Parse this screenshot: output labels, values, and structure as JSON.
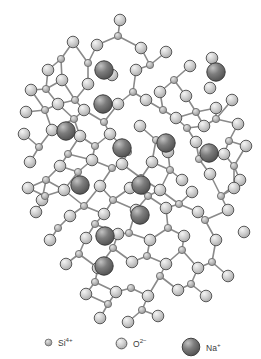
{
  "figure": {
    "background_color": "#ffffff",
    "width": 261,
    "height": 359
  },
  "species": {
    "si": {
      "id": "Si4+",
      "label_base": "Si",
      "label_sup": "4+",
      "icon": "small-circle-marker",
      "radius": 3.6,
      "fill": "#b4b4b4",
      "stroke": "#6e6e6e",
      "highlight": "#e8e8e8"
    },
    "o": {
      "id": "O2-",
      "label_base": "O",
      "label_sup": "2−",
      "icon": "medium-circle-marker",
      "radius": 5.8,
      "fill": "#c9c9c9",
      "stroke": "#5a5a5a",
      "highlight": "#f2f2f2"
    },
    "na": {
      "id": "Na+",
      "label_base": "Na",
      "label_sup": "+",
      "icon": "large-sphere-marker",
      "radius": 9.2,
      "fill": "#6a6a6a",
      "stroke": "#3c3c3c",
      "highlight": "#bdbdbd"
    }
  },
  "legend": {
    "position": "bottom",
    "items": [
      {
        "species": "si",
        "x": 44,
        "y": 14,
        "marker_r": 3.6,
        "label_base": "Si",
        "label_sup": "4+"
      },
      {
        "species": "o",
        "x": 115,
        "y": 14,
        "marker_r": 5.6,
        "label_base": "O",
        "label_sup": "2−"
      },
      {
        "species": "na",
        "x": 181,
        "y": 14,
        "marker_r": 9.0,
        "label_base": "Na",
        "label_sup": "+"
      }
    ]
  },
  "bonds": {
    "stroke": "#8a8a8a",
    "width": 1.6,
    "pairs": [
      [
        0,
        1
      ],
      [
        1,
        2
      ],
      [
        2,
        3
      ],
      [
        3,
        4
      ],
      [
        4,
        5
      ],
      [
        5,
        6
      ],
      [
        6,
        7
      ],
      [
        8,
        9
      ],
      [
        9,
        10
      ],
      [
        10,
        11
      ],
      [
        11,
        12
      ],
      [
        12,
        13
      ],
      [
        14,
        15
      ],
      [
        15,
        16
      ],
      [
        16,
        17
      ],
      [
        17,
        18
      ],
      [
        19,
        20
      ],
      [
        20,
        21
      ],
      [
        21,
        22
      ],
      [
        22,
        23
      ],
      [
        23,
        24
      ],
      [
        25,
        26
      ],
      [
        26,
        27
      ],
      [
        27,
        28
      ],
      [
        28,
        29
      ],
      [
        30,
        31
      ],
      [
        31,
        32
      ],
      [
        32,
        33
      ],
      [
        33,
        34
      ],
      [
        34,
        35
      ],
      [
        36,
        37
      ],
      [
        37,
        38
      ],
      [
        38,
        39
      ],
      [
        39,
        40
      ],
      [
        41,
        42
      ],
      [
        42,
        43
      ],
      [
        43,
        44
      ],
      [
        44,
        45
      ],
      [
        45,
        46
      ],
      [
        47,
        48
      ],
      [
        48,
        49
      ],
      [
        49,
        50
      ],
      [
        50,
        51
      ]
    ]
  },
  "atoms": {
    "si": [
      {
        "x": 118,
        "y": 36
      },
      {
        "x": 61,
        "y": 59
      },
      {
        "x": 88,
        "y": 63
      },
      {
        "x": 150,
        "y": 65
      },
      {
        "x": 46,
        "y": 89
      },
      {
        "x": 75,
        "y": 100
      },
      {
        "x": 133,
        "y": 92
      },
      {
        "x": 174,
        "y": 80
      },
      {
        "x": 45,
        "y": 110
      },
      {
        "x": 74,
        "y": 119
      },
      {
        "x": 104,
        "y": 122
      },
      {
        "x": 163,
        "y": 110
      },
      {
        "x": 196,
        "y": 112
      },
      {
        "x": 39,
        "y": 147
      },
      {
        "x": 68,
        "y": 154
      },
      {
        "x": 95,
        "y": 146
      },
      {
        "x": 128,
        "y": 152
      },
      {
        "x": 156,
        "y": 140
      },
      {
        "x": 187,
        "y": 128
      },
      {
        "x": 216,
        "y": 119
      },
      {
        "x": 229,
        "y": 141
      },
      {
        "x": 46,
        "y": 180
      },
      {
        "x": 78,
        "y": 172
      },
      {
        "x": 112,
        "y": 168
      },
      {
        "x": 141,
        "y": 178
      },
      {
        "x": 170,
        "y": 170
      },
      {
        "x": 199,
        "y": 159
      },
      {
        "x": 234,
        "y": 166
      },
      {
        "x": 45,
        "y": 196
      },
      {
        "x": 84,
        "y": 206
      },
      {
        "x": 113,
        "y": 200
      },
      {
        "x": 148,
        "y": 196
      },
      {
        "x": 179,
        "y": 204
      },
      {
        "x": 221,
        "y": 196
      },
      {
        "x": 58,
        "y": 228
      },
      {
        "x": 95,
        "y": 224
      },
      {
        "x": 129,
        "y": 233
      },
      {
        "x": 168,
        "y": 228
      },
      {
        "x": 205,
        "y": 220
      },
      {
        "x": 79,
        "y": 254
      },
      {
        "x": 113,
        "y": 248
      },
      {
        "x": 147,
        "y": 256
      },
      {
        "x": 182,
        "y": 250
      },
      {
        "x": 212,
        "y": 262
      },
      {
        "x": 95,
        "y": 282
      },
      {
        "x": 131,
        "y": 288
      },
      {
        "x": 160,
        "y": 276
      },
      {
        "x": 191,
        "y": 284
      },
      {
        "x": 108,
        "y": 304
      },
      {
        "x": 142,
        "y": 310
      }
    ],
    "o": [
      {
        "x": 120,
        "y": 20
      },
      {
        "x": 97,
        "y": 45
      },
      {
        "x": 141,
        "y": 48
      },
      {
        "x": 73,
        "y": 42
      },
      {
        "x": 48,
        "y": 70
      },
      {
        "x": 166,
        "y": 52
      },
      {
        "x": 190,
        "y": 66
      },
      {
        "x": 212,
        "y": 58
      },
      {
        "x": 31,
        "y": 90
      },
      {
        "x": 62,
        "y": 80
      },
      {
        "x": 88,
        "y": 84
      },
      {
        "x": 112,
        "y": 75
      },
      {
        "x": 136,
        "y": 70
      },
      {
        "x": 160,
        "y": 92
      },
      {
        "x": 186,
        "y": 96
      },
      {
        "x": 210,
        "y": 88
      },
      {
        "x": 232,
        "y": 100
      },
      {
        "x": 26,
        "y": 112
      },
      {
        "x": 58,
        "y": 104
      },
      {
        "x": 84,
        "y": 110
      },
      {
        "x": 118,
        "y": 104
      },
      {
        "x": 146,
        "y": 100
      },
      {
        "x": 176,
        "y": 118
      },
      {
        "x": 204,
        "y": 126
      },
      {
        "x": 238,
        "y": 124
      },
      {
        "x": 24,
        "y": 134
      },
      {
        "x": 52,
        "y": 130
      },
      {
        "x": 80,
        "y": 136
      },
      {
        "x": 110,
        "y": 134
      },
      {
        "x": 140,
        "y": 126
      },
      {
        "x": 168,
        "y": 152
      },
      {
        "x": 196,
        "y": 142
      },
      {
        "x": 224,
        "y": 154
      },
      {
        "x": 246,
        "y": 146
      },
      {
        "x": 30,
        "y": 162
      },
      {
        "x": 60,
        "y": 166
      },
      {
        "x": 92,
        "y": 160
      },
      {
        "x": 122,
        "y": 164
      },
      {
        "x": 152,
        "y": 162
      },
      {
        "x": 182,
        "y": 180
      },
      {
        "x": 210,
        "y": 174
      },
      {
        "x": 240,
        "y": 180
      },
      {
        "x": 28,
        "y": 188
      },
      {
        "x": 64,
        "y": 190
      },
      {
        "x": 100,
        "y": 186
      },
      {
        "x": 130,
        "y": 188
      },
      {
        "x": 160,
        "y": 190
      },
      {
        "x": 192,
        "y": 192
      },
      {
        "x": 234,
        "y": 188
      },
      {
        "x": 36,
        "y": 212
      },
      {
        "x": 70,
        "y": 216
      },
      {
        "x": 104,
        "y": 214
      },
      {
        "x": 136,
        "y": 210
      },
      {
        "x": 166,
        "y": 208
      },
      {
        "x": 198,
        "y": 212
      },
      {
        "x": 228,
        "y": 210
      },
      {
        "x": 50,
        "y": 240
      },
      {
        "x": 86,
        "y": 238
      },
      {
        "x": 118,
        "y": 234
      },
      {
        "x": 150,
        "y": 240
      },
      {
        "x": 184,
        "y": 236
      },
      {
        "x": 216,
        "y": 240
      },
      {
        "x": 244,
        "y": 232
      },
      {
        "x": 66,
        "y": 264
      },
      {
        "x": 98,
        "y": 268
      },
      {
        "x": 132,
        "y": 262
      },
      {
        "x": 166,
        "y": 264
      },
      {
        "x": 198,
        "y": 268
      },
      {
        "x": 228,
        "y": 276
      },
      {
        "x": 86,
        "y": 294
      },
      {
        "x": 116,
        "y": 292
      },
      {
        "x": 148,
        "y": 296
      },
      {
        "x": 178,
        "y": 290
      },
      {
        "x": 206,
        "y": 296
      },
      {
        "x": 100,
        "y": 318
      },
      {
        "x": 128,
        "y": 322
      },
      {
        "x": 158,
        "y": 316
      },
      {
        "x": 42,
        "y": 200
      },
      {
        "x": 216,
        "y": 108
      }
    ],
    "na": [
      {
        "x": 104,
        "y": 70
      },
      {
        "x": 216,
        "y": 72
      },
      {
        "x": 103,
        "y": 104
      },
      {
        "x": 66,
        "y": 131
      },
      {
        "x": 122,
        "y": 148
      },
      {
        "x": 166,
        "y": 143
      },
      {
        "x": 209,
        "y": 153
      },
      {
        "x": 80,
        "y": 185
      },
      {
        "x": 141,
        "y": 185
      },
      {
        "x": 105,
        "y": 236
      },
      {
        "x": 140,
        "y": 215
      },
      {
        "x": 104,
        "y": 266
      }
    ]
  }
}
